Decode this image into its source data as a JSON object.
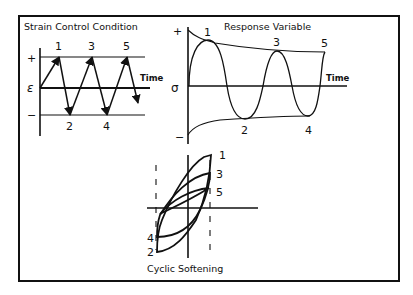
{
  "figure": {
    "strain_panel": {
      "title": "Strain Control Condition",
      "y_symbol": "ε",
      "plus": "+",
      "minus": "−",
      "time_label": "Time",
      "peak_labels": [
        "1",
        "3",
        "5"
      ],
      "trough_labels": [
        "2",
        "4"
      ]
    },
    "response_panel": {
      "title": "Response Variable",
      "y_symbol": "σ",
      "plus": "+",
      "minus": "−",
      "time_label": "Time",
      "peak_labels": [
        "1",
        "3",
        "5"
      ],
      "trough_labels": [
        "2",
        "4"
      ]
    },
    "hysteresis_panel": {
      "caption": "Cyclic Softening",
      "upper_labels": [
        "1",
        "3",
        "5"
      ],
      "lower_labels": [
        "4",
        "2"
      ]
    },
    "colors": {
      "line": "#111111",
      "background": "#ffffff"
    }
  }
}
